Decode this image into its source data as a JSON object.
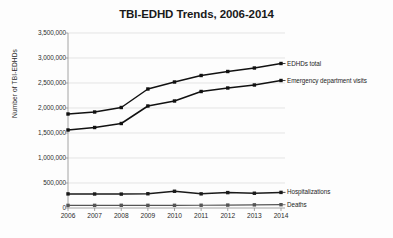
{
  "chart_data": {
    "type": "line",
    "title": "TBI-EDHD Trends, 2006-2014",
    "xlabel": "",
    "ylabel": "Number of TBI-EDHDs",
    "categories": [
      "2006",
      "2007",
      "2008",
      "2009",
      "2010",
      "2011",
      "2012",
      "2013",
      "2014"
    ],
    "x": [
      2006,
      2007,
      2008,
      2009,
      2010,
      2011,
      2012,
      2013,
      2014
    ],
    "ylim": [
      0,
      3500000
    ],
    "ytick_values": [
      0,
      500000,
      1000000,
      1500000,
      2000000,
      2500000,
      3000000,
      3500000
    ],
    "ytick_labels": [
      "0",
      "500,000",
      "1,000,000",
      "1,500,000",
      "2,000,000",
      "2,500,000",
      "3,000,000",
      "3,500,000"
    ],
    "grid": true,
    "legend_position": "right-inline-labels",
    "series": [
      {
        "name": "EDHDs total",
        "values": [
          1880000,
          1920000,
          2010000,
          2380000,
          2520000,
          2650000,
          2730000,
          2800000,
          2890000
        ],
        "color": "#111111",
        "marker": "square"
      },
      {
        "name": "Emergency department visits",
        "values": [
          1560000,
          1610000,
          1690000,
          2040000,
          2140000,
          2330000,
          2400000,
          2460000,
          2550000
        ],
        "color": "#111111",
        "marker": "square"
      },
      {
        "name": "Hospitalizations",
        "values": [
          282000,
          280000,
          278000,
          285000,
          335000,
          283000,
          308000,
          295000,
          312000
        ],
        "color": "#1a1a1a",
        "marker": "square"
      },
      {
        "name": "Deaths",
        "values": [
          52000,
          53000,
          54000,
          53000,
          54000,
          55000,
          58000,
          63000,
          66000
        ],
        "color": "#555555",
        "marker": "square"
      }
    ]
  },
  "style": {
    "background": "#fdfdfd",
    "grid_color": "#d8d8d8",
    "axis_color": "#9a9a9a",
    "text_color": "#2b2b2b"
  }
}
